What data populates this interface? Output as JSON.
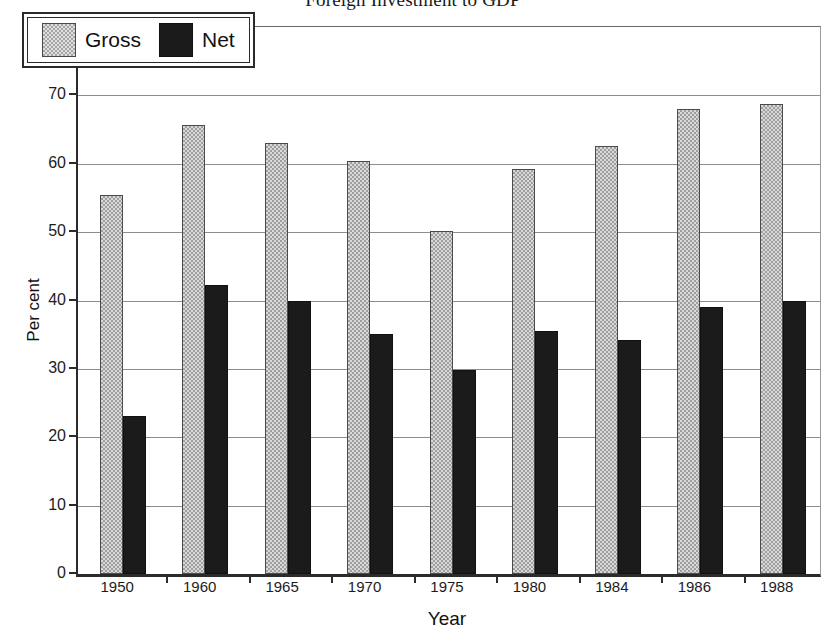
{
  "chart_data": {
    "type": "bar",
    "title": "Foreign Investment to GDP",
    "xlabel": "Year",
    "ylabel": "Per cent",
    "categories": [
      "1950",
      "1960",
      "1965",
      "1970",
      "1975",
      "1980",
      "1984",
      "1986",
      "1988"
    ],
    "series": [
      {
        "name": "Gross",
        "color": "#d9d9d9",
        "values": [
          55.5,
          65.6,
          63.1,
          60.4,
          50.2,
          59.3,
          62.6,
          68.0,
          68.7
        ]
      },
      {
        "name": "Net",
        "color": "#1b1b1b",
        "values": [
          23.1,
          42.3,
          39.9,
          35.1,
          29.8,
          35.6,
          34.2,
          39.1,
          39.9
        ]
      }
    ],
    "ylim": [
      0,
      80
    ],
    "yticks": [
      0,
      10,
      20,
      30,
      40,
      50,
      60,
      70,
      80
    ],
    "ytick_labels": [
      "0",
      "10",
      "20",
      "30",
      "40",
      "50",
      "60",
      "70",
      "80"
    ],
    "grid": true,
    "legend_position": "top-left",
    "legend_entries": [
      "Gross",
      "Net"
    ]
  }
}
